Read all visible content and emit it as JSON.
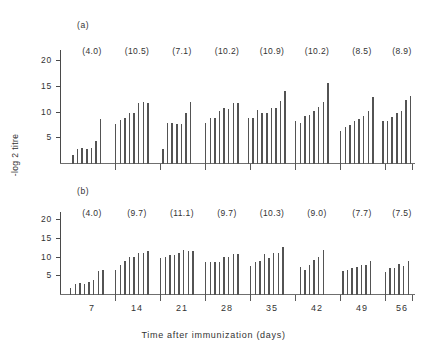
{
  "chart_data": {
    "type": "bar",
    "title": "",
    "xlabel": "Time after immunization (days)",
    "ylabel": "-log 2 titre",
    "ylim": [
      0,
      22
    ],
    "yticks": [
      5,
      10,
      15,
      20
    ],
    "xticks": [
      7,
      14,
      21,
      28,
      35,
      42,
      49,
      56
    ],
    "grid": false,
    "legend": "none",
    "panels": [
      {
        "label": "(a)",
        "group_means": [
          "(4.0)",
          "(10.5)",
          "(7.1)",
          "(10.2)",
          "(10.9)",
          "(10.2)",
          "(8.5)",
          "(8.9)"
        ],
        "groups": [
          {
            "week": 7,
            "mean": 4.0,
            "values": [
              1.8,
              3.0,
              3.2,
              3.0,
              3.2,
              4.5,
              8.7
            ]
          },
          {
            "week": 14,
            "mean": 10.5,
            "values": [
              7.7,
              8.6,
              9.0,
              9.9,
              10.0,
              11.8,
              12.0,
              11.9
            ]
          },
          {
            "week": 21,
            "mean": 7.1,
            "values": [
              3.0,
              8.0,
              7.9,
              7.8,
              7.7,
              9.9,
              12.0
            ]
          },
          {
            "week": 28,
            "mean": 10.2,
            "values": [
              7.9,
              9.0,
              8.9,
              10.4,
              10.9,
              10.7,
              11.9,
              11.9
            ]
          },
          {
            "week": 35,
            "mean": 10.9,
            "values": [
              8.9,
              9.0,
              10.5,
              9.9,
              10.0,
              11.0,
              10.9,
              12.2,
              14.3
            ]
          },
          {
            "week": 42,
            "mean": 10.2,
            "values": [
              8.3,
              8.0,
              9.4,
              9.5,
              10.3,
              11.1,
              12.0,
              15.7
            ]
          },
          {
            "week": 49,
            "mean": 8.5,
            "values": [
              6.5,
              7.2,
              7.6,
              8.3,
              8.8,
              9.4,
              10.3,
              13.1
            ]
          },
          {
            "week": 56,
            "mean": 8.9,
            "values": [
              8.4,
              8.4,
              9.2,
              10.0,
              10.3,
              12.5,
              13.3
            ]
          }
        ]
      },
      {
        "label": "(b)",
        "group_means": [
          "(4.0)",
          "(9.7)",
          "(11.1)",
          "(9.7)",
          "(10.3)",
          "(9.0)",
          "(7.7)",
          "(7.5)"
        ],
        "groups": [
          {
            "week": 7,
            "mean": 4.0,
            "values": [
              1.9,
              3.0,
              3.1,
              3.0,
              3.5,
              4.1,
              6.5,
              6.6
            ]
          },
          {
            "week": 14,
            "mean": 9.7,
            "values": [
              6.8,
              8.1,
              9.2,
              10.3,
              10.2,
              11.2,
              11.4,
              11.8
            ]
          },
          {
            "week": 21,
            "mean": 11.1,
            "values": [
              10.0,
              10.1,
              10.7,
              10.8,
              11.3,
              12.2,
              11.7,
              11.8
            ]
          },
          {
            "week": 28,
            "mean": 9.7,
            "values": [
              8.9,
              8.9,
              8.9,
              8.9,
              10.1,
              10.3,
              11.0,
              11.0
            ]
          },
          {
            "week": 35,
            "mean": 10.3,
            "values": [
              7.7,
              8.8,
              9.0,
              11.0,
              10.0,
              11.2,
              11.4,
              13.0
            ]
          },
          {
            "week": 42,
            "mean": 9.0,
            "values": [
              7.4,
              6.6,
              8.0,
              9.4,
              10.2,
              12.1
            ]
          },
          {
            "week": 49,
            "mean": 7.7,
            "values": [
              6.4,
              6.7,
              7.3,
              7.6,
              8.0,
              8.0,
              9.0
            ]
          },
          {
            "week": 56,
            "mean": 7.5,
            "values": [
              6.2,
              7.2,
              7.3,
              8.3,
              7.9,
              9.0
            ]
          }
        ]
      }
    ]
  }
}
